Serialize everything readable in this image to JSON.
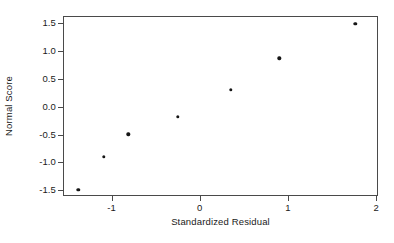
{
  "chart_data": {
    "type": "scatter",
    "title": "",
    "xlabel": "Standardized Residual",
    "ylabel": "Normal Score",
    "xlim": [
      -1.55,
      2.02
    ],
    "ylim": [
      -1.6,
      1.62
    ],
    "grid": false,
    "legend": null,
    "marker": {
      "shape": "filled-circle",
      "color": "#161616",
      "size_px": 3.4
    },
    "frame_color": "#4a4a4a",
    "background_color": "#ffffff",
    "xticks": [
      -1,
      0,
      1,
      2
    ],
    "xtick_labels": [
      "-1",
      "0",
      "1",
      "2"
    ],
    "yticks": [
      1.5,
      1.0,
      0.5,
      0.0,
      -0.5,
      -1.0,
      -1.5
    ],
    "ytick_labels": [
      "1.5",
      "1.0",
      "0.5",
      "0.0",
      "-0.5",
      "-1.0",
      "-1.5"
    ],
    "points": [
      {
        "x": -1.39,
        "y": -1.47
      },
      {
        "x": -1.1,
        "y": -0.88
      },
      {
        "x": -0.82,
        "y": -0.48
      },
      {
        "x": -0.26,
        "y": -0.17
      },
      {
        "x": 0.34,
        "y": 0.32
      },
      {
        "x": 0.89,
        "y": 0.88
      },
      {
        "x": 1.75,
        "y": 1.5
      }
    ],
    "series": [
      {
        "name": "Normal probability plot",
        "x": [
          -1.39,
          -1.1,
          -0.82,
          -0.26,
          0.34,
          0.89,
          1.75
        ],
        "values": [
          -1.47,
          -0.88,
          -0.48,
          -0.17,
          0.32,
          0.88,
          1.5
        ]
      }
    ]
  }
}
